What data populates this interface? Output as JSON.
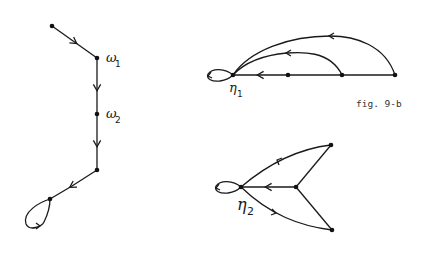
{
  "figure": {
    "caption": "fig. 9-b",
    "graphs": [
      {
        "id": "chain",
        "nodes": [
          {
            "id": "a",
            "label": ""
          },
          {
            "id": "w1",
            "label": "ω",
            "subscript": "1"
          },
          {
            "id": "w2",
            "label": "ω",
            "subscript": "2"
          },
          {
            "id": "b",
            "label": ""
          },
          {
            "id": "c",
            "label": "",
            "self_loop": true
          }
        ],
        "edges": [
          [
            "a",
            "w1"
          ],
          [
            "w1",
            "w2"
          ],
          [
            "w2",
            "b"
          ],
          [
            "b",
            "c"
          ],
          [
            "c",
            "c"
          ]
        ]
      },
      {
        "id": "eta1",
        "nodes": [
          {
            "id": "n1",
            "label": "η",
            "subscript": "1",
            "self_loop": true
          },
          {
            "id": "p",
            "label": ""
          },
          {
            "id": "q",
            "label": ""
          },
          {
            "id": "r",
            "label": ""
          }
        ],
        "edges": [
          [
            "p",
            "n1"
          ],
          [
            "q",
            "p"
          ],
          [
            "q",
            "n1"
          ],
          [
            "r",
            "q"
          ],
          [
            "r",
            "n1"
          ],
          [
            "n1",
            "n1"
          ]
        ]
      },
      {
        "id": "eta2",
        "nodes": [
          {
            "id": "n2",
            "label": "η",
            "subscript": "2",
            "self_loop": true
          },
          {
            "id": "m",
            "label": ""
          },
          {
            "id": "t",
            "label": ""
          },
          {
            "id": "u",
            "label": ""
          }
        ],
        "edges": [
          [
            "m",
            "n2"
          ],
          [
            "t",
            "m"
          ],
          [
            "u",
            "m"
          ],
          [
            "t",
            "n2"
          ],
          [
            "u",
            "n2"
          ],
          [
            "n2",
            "n2"
          ]
        ]
      }
    ]
  }
}
